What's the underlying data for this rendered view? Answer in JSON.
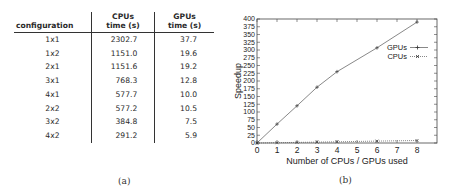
{
  "table": {
    "headers": {
      "configuration": "configuration",
      "cpu_line1": "CPUs",
      "cpu_line2": "time (s)",
      "gpu_line1": "GPUs",
      "gpu_line2": "time (s)"
    },
    "rows": [
      {
        "configuration": "1x1",
        "cpu_time": "2302.7",
        "gpu_time": "37.7"
      },
      {
        "configuration": "1x2",
        "cpu_time": "1151.0",
        "gpu_time": "19.6"
      },
      {
        "configuration": "2x1",
        "cpu_time": "1151.6",
        "gpu_time": "19.2"
      },
      {
        "configuration": "3x1",
        "cpu_time": "768.3",
        "gpu_time": "12.8"
      },
      {
        "configuration": "4x1",
        "cpu_time": "577.7",
        "gpu_time": "10.0"
      },
      {
        "configuration": "2x2",
        "cpu_time": "577.2",
        "gpu_time": "10.5"
      },
      {
        "configuration": "3x2",
        "cpu_time": "384.8",
        "gpu_time": "7.5"
      },
      {
        "configuration": "4x2",
        "cpu_time": "291.2",
        "gpu_time": "5.9"
      }
    ],
    "caption": "(a)"
  },
  "chart": {
    "caption": "(b)",
    "ylabel": "Speedup",
    "xlabel": "Number of CPUs / GPUs used",
    "yticks": [
      "0",
      "25",
      "50",
      "75",
      "100",
      "125",
      "150",
      "175",
      "200",
      "225",
      "250",
      "275",
      "300",
      "325",
      "350",
      "375",
      "400"
    ],
    "xticks": [
      "0",
      "1",
      "2",
      "3",
      "4",
      "5",
      "6",
      "7",
      "8"
    ],
    "legend": {
      "gpus": "GPUs",
      "cpus": "CPUs"
    }
  },
  "chart_data": {
    "type": "line",
    "title": "",
    "xlabel": "Number of CPUs / GPUs used",
    "ylabel": "Speedup",
    "xlim": [
      0,
      9
    ],
    "ylim": [
      0,
      400
    ],
    "grid": false,
    "legend_position": "upper right (inside)",
    "series": [
      {
        "name": "GPUs",
        "style": "solid line, + markers",
        "x": [
          0,
          1,
          2,
          3,
          4,
          6,
          8
        ],
        "y": [
          0,
          61,
          120,
          180,
          230,
          307,
          390
        ]
      },
      {
        "name": "CPUs",
        "style": "dotted line, x markers",
        "x": [
          0,
          1,
          2,
          3,
          4,
          6,
          8
        ],
        "y": [
          0,
          1,
          2,
          3,
          4,
          6,
          8
        ]
      }
    ]
  }
}
